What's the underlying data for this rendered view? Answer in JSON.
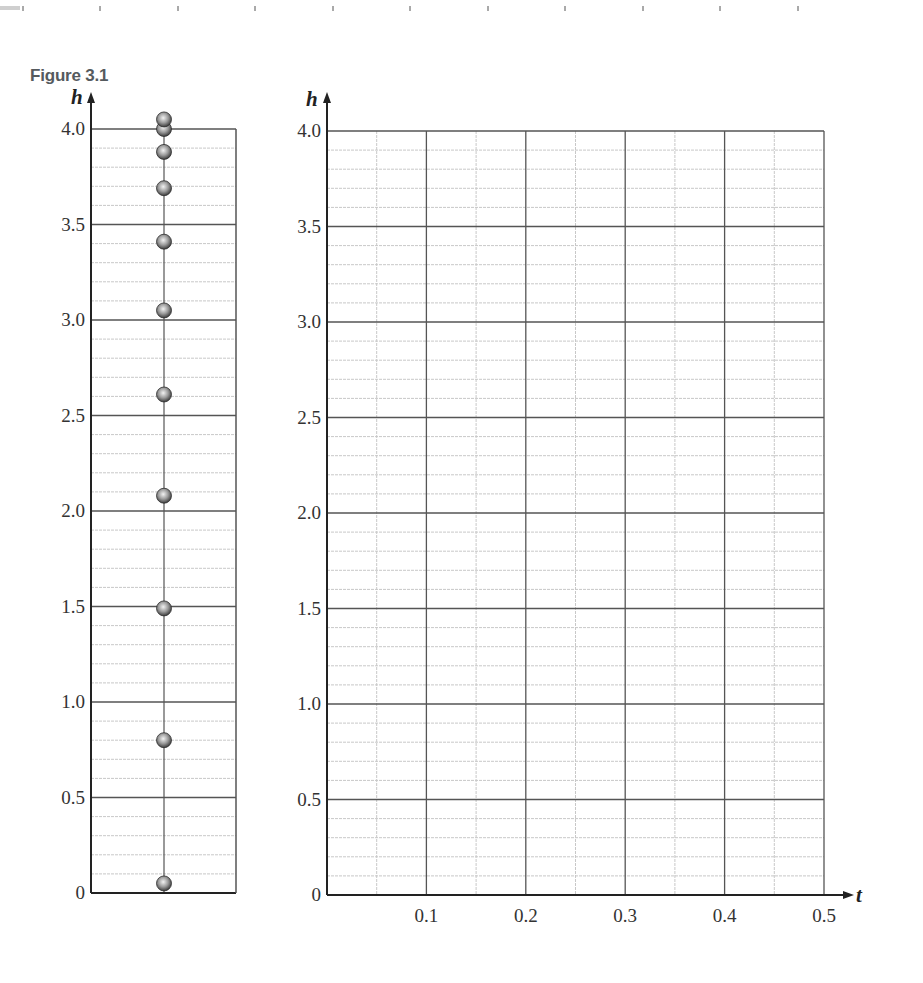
{
  "figure": {
    "title": "Figure 3.1"
  },
  "colors": {
    "major_grid": "#555555",
    "minor_grid": "#c8c8c8",
    "axis": "#222222",
    "ball_light": "#f2f2f2",
    "ball_mid": "#9a9a9a",
    "ball_dark": "#3c3c3c"
  },
  "chart_data": [
    {
      "type": "scatter",
      "title": "Figure 3.1 (strobe positions of falling ball)",
      "xlabel": "",
      "ylabel": "h",
      "ylim": [
        0,
        4.0
      ],
      "yticks": [
        "0",
        "0.5",
        "1.0",
        "1.5",
        "2.0",
        "2.5",
        "3.0",
        "3.5",
        "4.0"
      ],
      "minor_grid_step": 0.1,
      "grid": true,
      "x": [
        0,
        0,
        0,
        0,
        0,
        0,
        0,
        0,
        0,
        0,
        0
      ],
      "values": [
        4.05,
        4.0,
        3.88,
        3.69,
        3.41,
        3.05,
        2.61,
        2.08,
        1.49,
        0.8,
        0.05
      ],
      "legend": []
    },
    {
      "type": "line",
      "title": "Blank h vs t graph grid",
      "xlabel": "t",
      "ylabel": "h",
      "xlim": [
        0,
        0.5
      ],
      "ylim": [
        0,
        4.0
      ],
      "xticks": [
        "0.1",
        "0.2",
        "0.3",
        "0.4",
        "0.5"
      ],
      "yticks": [
        "0",
        "0.5",
        "1.0",
        "1.5",
        "2.0",
        "2.5",
        "3.0",
        "3.5",
        "4.0"
      ],
      "minor_x_step": 0.05,
      "minor_y_step": 0.1,
      "grid": true,
      "series": [],
      "legend": []
    }
  ]
}
